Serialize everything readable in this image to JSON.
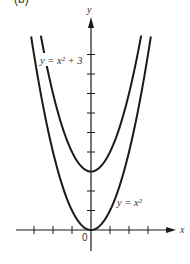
{
  "figure": {
    "panel_label": "(b)",
    "background": "#ffffff",
    "ink": "#1a1a1a"
  },
  "chart_data": {
    "type": "line",
    "title": "",
    "xlabel": "x",
    "ylabel": "y",
    "origin_label": "0",
    "xlim": [
      -4,
      4.5
    ],
    "ylim": [
      -1,
      10
    ],
    "x_ticks": [
      -3,
      -2,
      -1,
      1,
      2,
      3
    ],
    "y_ticks": [
      1,
      2,
      3,
      4,
      5,
      6,
      7,
      8,
      9
    ],
    "tick_labels_shown": false,
    "grid": false,
    "series": [
      {
        "name": "y = x^2",
        "label_text": "y = x²",
        "formula": "x^2",
        "x_range": [
          -3.15,
          3.15
        ],
        "vertex": [
          0,
          0
        ],
        "sample_points": [
          [
            -3,
            9
          ],
          [
            -2,
            4
          ],
          [
            -1,
            1
          ],
          [
            0,
            0
          ],
          [
            1,
            1
          ],
          [
            2,
            4
          ],
          [
            3,
            9
          ]
        ]
      },
      {
        "name": "y = x^2 + 3",
        "label_text": "y = x² + 3",
        "formula": "x^2 + 3",
        "x_range": [
          -2.64,
          2.64
        ],
        "vertex": [
          0,
          3
        ],
        "sample_points": [
          [
            -2.5,
            9.25
          ],
          [
            -2,
            7
          ],
          [
            -1,
            4
          ],
          [
            0,
            3
          ],
          [
            1,
            4
          ],
          [
            2,
            7
          ],
          [
            2.5,
            9.25
          ]
        ]
      }
    ]
  }
}
